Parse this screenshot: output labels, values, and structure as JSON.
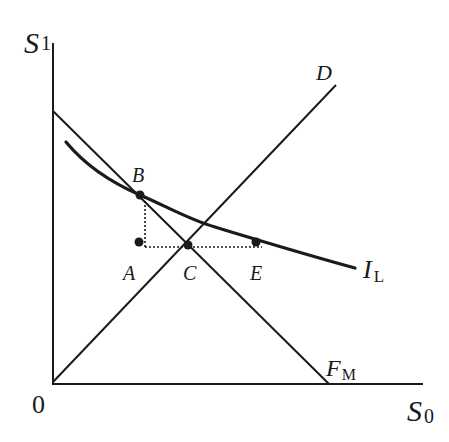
{
  "diagram": {
    "type": "economic-diagram",
    "axes": {
      "x": {
        "label": "S",
        "subscript": "0"
      },
      "y": {
        "label": "S",
        "subscript": "1"
      },
      "origin_label": "0"
    },
    "lines": {
      "diagonal": {
        "label": "D"
      },
      "frontier": {
        "label": "F",
        "subscript": "M"
      },
      "indifference_curve": {
        "label": "I",
        "subscript": "L"
      }
    },
    "points": [
      {
        "id": "A",
        "label": "A"
      },
      {
        "id": "B",
        "label": "B"
      },
      {
        "id": "C",
        "label": "C"
      },
      {
        "id": "E",
        "label": "E"
      }
    ],
    "colors": {
      "ink": "#1a1a1a",
      "background": "#ffffff"
    }
  }
}
